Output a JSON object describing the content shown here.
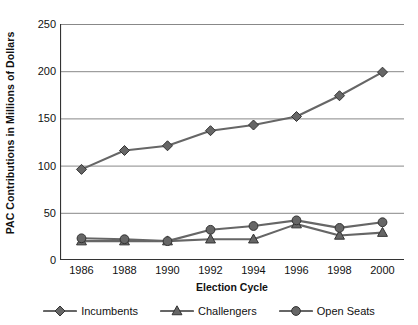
{
  "chart_data": {
    "type": "line",
    "title": "",
    "xlabel": "Election Cycle",
    "ylabel": "PAC Contributions in Millions of Dollars",
    "categories": [
      "1986",
      "1988",
      "1990",
      "1992",
      "1994",
      "1996",
      "1998",
      "2000"
    ],
    "x": [
      1986,
      1988,
      1990,
      1992,
      1994,
      1996,
      1998,
      2000
    ],
    "series": [
      {
        "name": "Incumbents",
        "marker": "diamond",
        "color": "#666666",
        "values": [
          96,
          116,
          121,
          137,
          143,
          152,
          174,
          199
        ]
      },
      {
        "name": "Challengers",
        "marker": "triangle",
        "color": "#666666",
        "values": [
          20,
          20,
          20,
          22,
          22,
          38,
          26,
          29
        ]
      },
      {
        "name": "Open Seats",
        "marker": "circle",
        "color": "#666666",
        "values": [
          23,
          22,
          20,
          32,
          36,
          42,
          34,
          40
        ]
      }
    ],
    "ylim": [
      0,
      250
    ],
    "yticks": [
      0,
      50,
      100,
      150,
      200,
      250
    ],
    "ytick_labels": [
      "0",
      "50",
      "100",
      "150",
      "200",
      "250"
    ],
    "grid": "horizontal",
    "legend_position": "bottom",
    "colors": {
      "line": "#666666",
      "marker_fill": "#666666",
      "marker_stroke": "#333333",
      "grid": "#888888",
      "axis": "#333333",
      "text": "#111111",
      "background": "#ffffff"
    }
  }
}
